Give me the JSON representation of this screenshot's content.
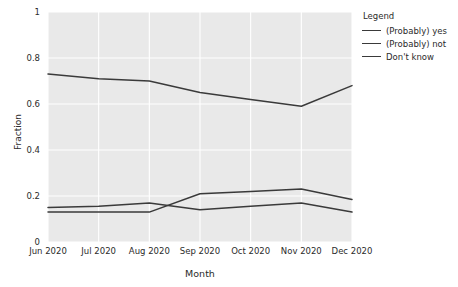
{
  "chart_data": {
    "type": "line",
    "title": "",
    "xlabel": "Month",
    "ylabel": "Fraction",
    "categories": [
      "Jun 2020",
      "Jul 2020",
      "Aug 2020",
      "Sep 2020",
      "Oct 2020",
      "Nov 2020",
      "Dec 2020"
    ],
    "ylim": [
      0,
      1
    ],
    "yticks": [
      "0",
      "0.2",
      "0.4",
      "0.6",
      "0.8",
      "1"
    ],
    "ytick_values": [
      0,
      0.2,
      0.4,
      0.6,
      0.8,
      1
    ],
    "grid": true,
    "legend_position": "right",
    "legend_title": "Legend",
    "series": [
      {
        "name": "(Probably) yes",
        "color": "#3a3a3a",
        "values": [
          0.73,
          0.71,
          0.7,
          0.65,
          0.62,
          0.59,
          0.68
        ]
      },
      {
        "name": "(Probably) not",
        "color": "#3a3a3a",
        "values": [
          0.13,
          0.13,
          0.13,
          0.21,
          0.22,
          0.23,
          0.185
        ]
      },
      {
        "name": "Don't know",
        "color": "#3a3a3a",
        "values": [
          0.15,
          0.155,
          0.17,
          0.14,
          0.155,
          0.17,
          0.13
        ]
      }
    ]
  },
  "style": {
    "plot_background": "#e9e9e9",
    "grid_color": "#ffffff",
    "axis_text_color": "#2b2b2b",
    "line_color": "#3a3a3a"
  }
}
